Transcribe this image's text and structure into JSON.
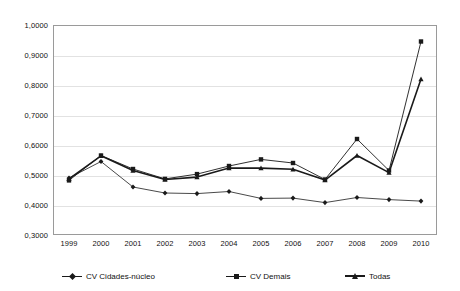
{
  "chart_data": {
    "type": "line",
    "title": "",
    "xlabel": "",
    "ylabel": "",
    "categories": [
      "1999",
      "2000",
      "2001",
      "2002",
      "2003",
      "2004",
      "2005",
      "2006",
      "2007",
      "2008",
      "2009",
      "2010"
    ],
    "ylim": [
      0.3,
      1.0
    ],
    "ytick_labels": [
      "1,0000",
      "0,9000",
      "0,8000",
      "0,7000",
      "0,6000",
      "0,5000",
      "0,4000",
      "0,3000"
    ],
    "ytick_values": [
      1.0,
      0.9,
      0.8,
      0.7,
      0.6,
      0.5,
      0.4,
      0.3
    ],
    "grid": true,
    "legend_position": "bottom",
    "series": [
      {
        "name": "CV Cidades-núcleo",
        "marker": "diamond",
        "color": "#1a1a1a",
        "values": [
          0.49,
          0.545,
          0.46,
          0.44,
          0.438,
          0.445,
          0.422,
          0.423,
          0.408,
          0.425,
          0.418,
          0.413
        ]
      },
      {
        "name": "CV Demais",
        "marker": "square",
        "color": "#1a1a1a",
        "values": [
          0.482,
          0.565,
          0.52,
          0.487,
          0.503,
          0.53,
          0.552,
          0.54,
          0.485,
          0.62,
          0.515,
          0.945
        ]
      },
      {
        "name": "Todas",
        "marker": "triangle",
        "color": "#1a1a1a",
        "values": [
          0.487,
          0.564,
          0.515,
          0.485,
          0.493,
          0.523,
          0.523,
          0.519,
          0.483,
          0.565,
          0.508,
          0.82
        ]
      }
    ]
  }
}
